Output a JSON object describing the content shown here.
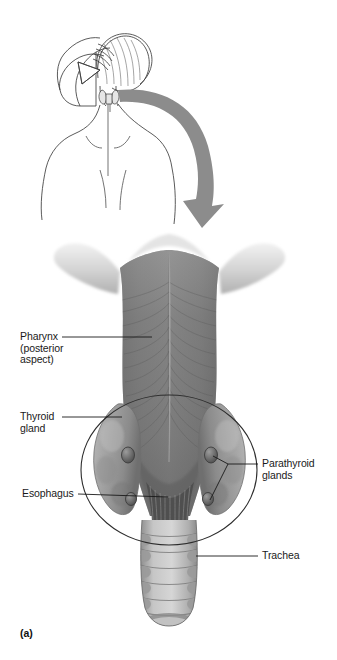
{
  "figure": {
    "caption": "(a)",
    "background_color": "#ffffff",
    "arrow_color": "#8c8c8c",
    "line_color": "#3a3a3a",
    "label_color": "#1a1a1a"
  },
  "orientation_inset": {
    "name": "woman-back-view-with-thyroid",
    "description": "line drawing of woman's upper back, head turned, hand lifting hair, small thyroid gland sketched on neck"
  },
  "arrow": {
    "name": "curved-down-arrow",
    "direction": "down"
  },
  "labels": [
    {
      "id": "pharynx",
      "text": "Pharynx\n(posterior\naspect)",
      "side": "left",
      "x": 20,
      "y": 332
    },
    {
      "id": "thyroid",
      "text": "Thyroid\ngland",
      "side": "left",
      "x": 20,
      "y": 411
    },
    {
      "id": "esophagus",
      "text": "Esophagus",
      "side": "left",
      "x": 22,
      "y": 489
    },
    {
      "id": "parathyroid",
      "text": "Parathyroid\nglands",
      "side": "right",
      "x": 262,
      "y": 460
    },
    {
      "id": "trachea",
      "text": "Trachea",
      "side": "right",
      "x": 262,
      "y": 551
    }
  ],
  "structures": [
    {
      "id": "pharynx-muscle",
      "label": "pharynx posterior aspect",
      "tone": "#7c7c7c"
    },
    {
      "id": "hyoid-wings",
      "label": "superior horns",
      "tone": "#cfcfcf"
    },
    {
      "id": "thyroid-lobe-left",
      "label": "thyroid gland left lobe",
      "tone": "#9a9a9a"
    },
    {
      "id": "thyroid-lobe-right",
      "label": "thyroid gland right lobe",
      "tone": "#9a9a9a"
    },
    {
      "id": "parathyroid-gland",
      "label": "parathyroid gland",
      "tone": "#6e6e6e",
      "count": 4
    },
    {
      "id": "esophagus-fibers",
      "label": "esophagus muscle fibers",
      "tone": "#5a5a5a"
    },
    {
      "id": "trachea-rings",
      "label": "tracheal cartilage rings",
      "tone": "#b5b5b5"
    },
    {
      "id": "highlight-circle",
      "label": "circle outlining thyroid and parathyroid region"
    }
  ]
}
